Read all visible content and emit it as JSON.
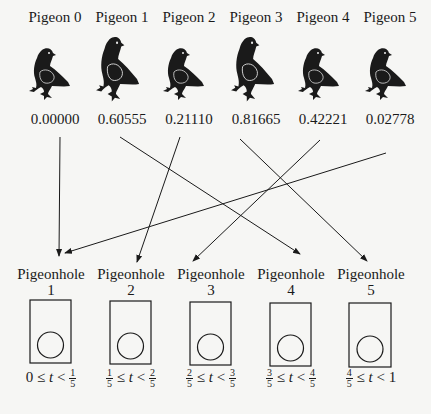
{
  "pigeons": [
    {
      "label": "Pigeon 0",
      "value": "0.00000",
      "hole": 1
    },
    {
      "label": "Pigeon 1",
      "value": "0.60555",
      "hole": 4
    },
    {
      "label": "Pigeon 2",
      "value": "0.21110",
      "hole": 2
    },
    {
      "label": "Pigeon 3",
      "value": "0.81665",
      "hole": 5
    },
    {
      "label": "Pigeon 4",
      "value": "0.42221",
      "hole": 3
    },
    {
      "label": "Pigeon 5",
      "value": "0.02778",
      "hole": 1
    }
  ],
  "pigeonholes": [
    {
      "label": "Pigeonhole",
      "number": "1",
      "range": {
        "left": "0",
        "left_frac": null,
        "right_frac": {
          "n": "1",
          "d": "5"
        },
        "right": null
      }
    },
    {
      "label": "Pigeonhole",
      "number": "2",
      "range": {
        "left_frac": {
          "n": "1",
          "d": "5"
        },
        "right_frac": {
          "n": "2",
          "d": "5"
        }
      }
    },
    {
      "label": "Pigeonhole",
      "number": "3",
      "range": {
        "left_frac": {
          "n": "2",
          "d": "5"
        },
        "right_frac": {
          "n": "3",
          "d": "5"
        }
      }
    },
    {
      "label": "Pigeonhole",
      "number": "4",
      "range": {
        "left_frac": {
          "n": "3",
          "d": "5"
        },
        "right_frac": {
          "n": "4",
          "d": "5"
        }
      }
    },
    {
      "label": "Pigeonhole",
      "number": "5",
      "range": {
        "left_frac": {
          "n": "4",
          "d": "5"
        },
        "right": "1"
      }
    }
  ],
  "symbols": {
    "le": "≤",
    "lt": "<",
    "var": "t"
  },
  "colors": {
    "ink": "#1a1a1a",
    "background": "#f6f6f4"
  }
}
